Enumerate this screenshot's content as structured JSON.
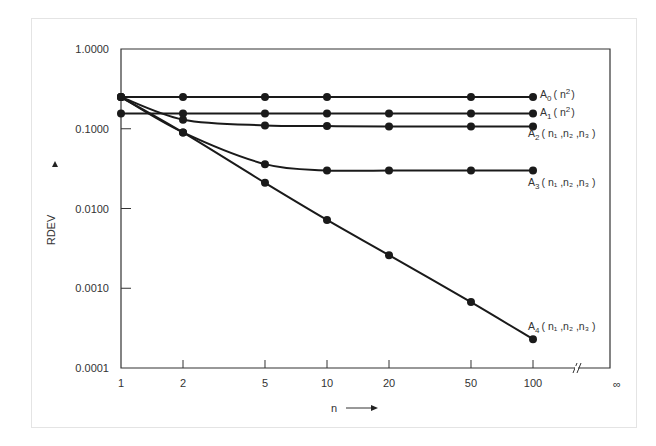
{
  "chart_data": {
    "type": "line",
    "title": "",
    "xlabel": "n",
    "ylabel": "RDEV",
    "xscale": "log",
    "yscale": "log",
    "ylim": [
      0.0001,
      1.0
    ],
    "xlim": [
      1,
      100
    ],
    "x_ticks": [
      "1",
      "2",
      "5",
      "10",
      "20",
      "50",
      "100"
    ],
    "x_break_label": "∞",
    "y_ticks": [
      "1.0000",
      "0.1000",
      "0.0100",
      "0.0010",
      "0.0001"
    ],
    "grid": false,
    "legend": "inline labels at right end of each series",
    "x": [
      1,
      2,
      5,
      10,
      20,
      50,
      100
    ],
    "series": [
      {
        "name": "A0 (n²)",
        "label_main": "A",
        "label_sub": "0",
        "label_rest": "( n",
        "label_sup": "2",
        "label_end": ")",
        "x": [
          1,
          2,
          5,
          10,
          50,
          100
        ],
        "values": [
          0.25,
          0.25,
          0.25,
          0.25,
          0.25,
          0.25
        ]
      },
      {
        "name": "A1 (n²)",
        "label_main": "A",
        "label_sub": "1",
        "label_rest": "( n",
        "label_sup": "2",
        "label_end": ")",
        "x": [
          1,
          2,
          5,
          10,
          20,
          50,
          100
        ],
        "values": [
          0.155,
          0.155,
          0.155,
          0.155,
          0.155,
          0.155,
          0.155
        ]
      },
      {
        "name": "A2 (n1,n2,n3)",
        "label_main": "A",
        "label_sub": "2",
        "label_rest": "( n₁ ,n₂ ,n₃ )",
        "x": [
          1,
          2,
          5,
          10,
          20,
          50,
          100
        ],
        "values": [
          0.25,
          0.13,
          0.11,
          0.108,
          0.107,
          0.107,
          0.107
        ]
      },
      {
        "name": "A3 (n1,n2,n3)",
        "label_main": "A",
        "label_sub": "3",
        "label_rest": "( n₁ ,n₂ ,n₃ )",
        "x": [
          1,
          2,
          5,
          10,
          20,
          50,
          100
        ],
        "values": [
          0.25,
          0.09,
          0.036,
          0.03,
          0.03,
          0.03,
          0.03
        ]
      },
      {
        "name": "A4 (n1,n2,n3)",
        "label_main": "A",
        "label_sub": "4",
        "label_rest": "( n₁ ,n₂ ,n₃ )",
        "x": [
          1,
          2,
          5,
          10,
          20,
          50,
          100
        ],
        "values": [
          0.25,
          0.09,
          0.021,
          0.0072,
          0.0026,
          0.00067,
          0.00023
        ]
      }
    ]
  }
}
